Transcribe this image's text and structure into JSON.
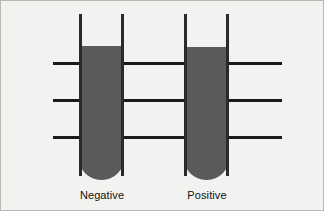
{
  "figure": {
    "background_color": "#f2f2f0",
    "border_color": "#b8b8b4",
    "line_color": "#1a1a1a",
    "tube_fill_color": "#5a5a5a",
    "tube_wall_color": "#2a2a2a"
  },
  "reference_lines": [
    {
      "name": "upper-line",
      "y": 61,
      "x_start": 52,
      "x_end": 281
    },
    {
      "name": "middle-line",
      "y": 98,
      "x_start": 52,
      "x_end": 281
    },
    {
      "name": "lower-line",
      "y": 135,
      "x_start": 52,
      "x_end": 281
    }
  ],
  "tubes": [
    {
      "id": "tube-negative",
      "label": "Negative",
      "x": 78,
      "width": 45,
      "top": 13,
      "bottom": 179,
      "fill_top": 45,
      "fill_level_percent": 81,
      "label_x": 41,
      "label_y": 188
    },
    {
      "id": "tube-positive",
      "label": "Positive",
      "x": 183,
      "width": 45,
      "top": 13,
      "bottom": 179,
      "fill_top": 46,
      "fill_level_percent": 80,
      "label_x": 146,
      "label_y": 188
    }
  ]
}
